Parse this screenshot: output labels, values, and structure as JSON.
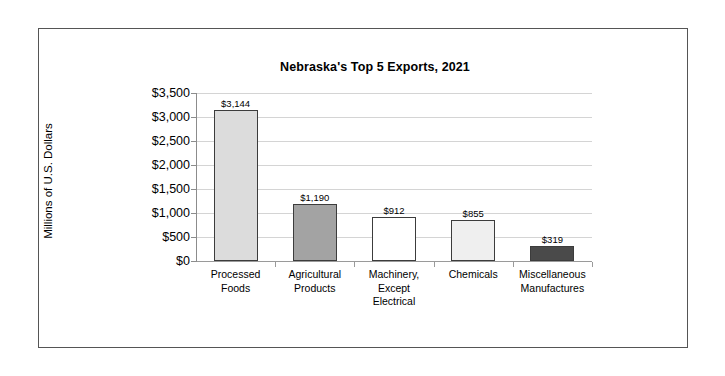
{
  "figure": {
    "border_color": "#555555",
    "background": "#ffffff"
  },
  "chart_data": {
    "type": "bar",
    "title": "Nebraska's Top 5 Exports, 2021",
    "xlabel": "",
    "ylabel": "Millions of U.S. Dollars",
    "ylim": [
      0,
      3500
    ],
    "ytick_step": 500,
    "grid": true,
    "legend": "none",
    "categories": [
      "Processed\nFoods",
      "Agricultural\nProducts",
      "Machinery,\nExcept\nElectrical",
      "Chemicals",
      "Miscellaneous\nManufactures"
    ],
    "values": [
      3144,
      1190,
      912,
      855,
      319
    ],
    "value_labels": [
      "$3,144",
      "$1,190",
      "$912",
      "$855",
      "$319"
    ],
    "bar_colors": [
      "#dcdcdc",
      "#a3a3a3",
      "#ffffff",
      "#efefef",
      "#4a4a4a"
    ],
    "bar_edge_color": "#3c3c3c",
    "ytick_labels": [
      "$3,500",
      "$3,000",
      "$2,500",
      "$2,000",
      "$1,500",
      "$1,000",
      "$500",
      "$0"
    ],
    "ytick_values": [
      3500,
      3000,
      2500,
      2000,
      1500,
      1000,
      500,
      0
    ]
  }
}
